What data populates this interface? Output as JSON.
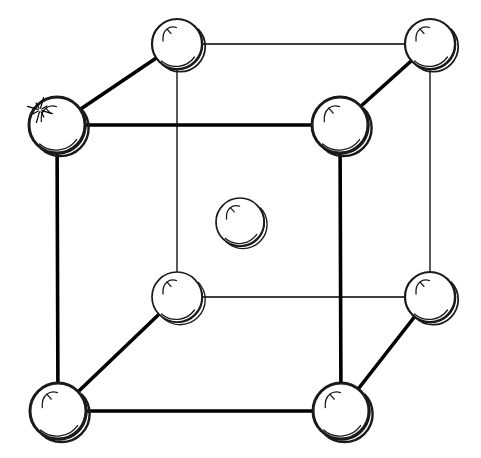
{
  "figure": {
    "background_color": "#ffffff",
    "line_color": "#000000",
    "sphere_fill_color": "#ffffff",
    "sphere_outline_color": "#1a1a1a",
    "canvas": {
      "width": 481,
      "height": 458
    }
  },
  "style": {
    "front_edge_width": 3.6,
    "back_edge_width": 1.3,
    "diagonal_edge_width": 3.6,
    "front_sphere_outline_width": 3.0,
    "back_sphere_outline_width": 1.6,
    "center_sphere_outline_width": 1.6,
    "gloss_stroke_width": 1.3
  },
  "atoms": [
    {
      "id": "corner-front-top-left",
      "label": "front top left corner atom",
      "cx": 57,
      "cy": 125,
      "r": 28,
      "layer": "front",
      "outline_width": 3.0,
      "has_sparkle": true
    },
    {
      "id": "corner-front-top-right",
      "label": "front top right corner atom",
      "cx": 340,
      "cy": 125,
      "r": 28,
      "layer": "front",
      "outline_width": 3.0,
      "has_sparkle": false
    },
    {
      "id": "corner-front-bottom-left",
      "label": "front bottom left corner atom",
      "cx": 58,
      "cy": 411,
      "r": 28,
      "layer": "front",
      "outline_width": 3.0,
      "has_sparkle": false
    },
    {
      "id": "corner-front-bottom-right",
      "label": "front bottom right corner atom",
      "cx": 341,
      "cy": 411,
      "r": 28,
      "layer": "front",
      "outline_width": 3.0,
      "has_sparkle": false
    },
    {
      "id": "corner-back-top-left",
      "label": "back top left corner atom",
      "cx": 177,
      "cy": 44,
      "r": 25,
      "layer": "back",
      "outline_width": 2.2,
      "has_sparkle": false
    },
    {
      "id": "corner-back-top-right",
      "label": "back top right corner atom",
      "cx": 430,
      "cy": 44,
      "r": 25,
      "layer": "back",
      "outline_width": 2.2,
      "has_sparkle": false
    },
    {
      "id": "corner-back-bottom-left",
      "label": "back bottom left corner atom",
      "cx": 177,
      "cy": 297,
      "r": 25,
      "layer": "back",
      "outline_width": 1.7,
      "has_sparkle": false
    },
    {
      "id": "corner-back-bottom-right",
      "label": "back bottom right corner atom",
      "cx": 430,
      "cy": 297,
      "r": 25,
      "layer": "back",
      "outline_width": 2.2,
      "has_sparkle": false
    },
    {
      "id": "atom-body-center",
      "label": "body center atom",
      "cx": 240,
      "cy": 222,
      "r": 24,
      "layer": "center",
      "outline_width": 1.7,
      "has_sparkle": false
    }
  ],
  "edges": [
    {
      "id": "edge-front-top",
      "label": "front top edge",
      "x1": 57,
      "y1": 125,
      "x2": 340,
      "y2": 125,
      "kind": "front"
    },
    {
      "id": "edge-front-left",
      "label": "front left edge",
      "x1": 57,
      "y1": 125,
      "x2": 58,
      "y2": 411,
      "kind": "front"
    },
    {
      "id": "edge-front-right",
      "label": "front right edge",
      "x1": 340,
      "y1": 125,
      "x2": 341,
      "y2": 411,
      "kind": "front"
    },
    {
      "id": "edge-front-bottom",
      "label": "front bottom edge",
      "x1": 58,
      "y1": 411,
      "x2": 341,
      "y2": 411,
      "kind": "front"
    },
    {
      "id": "edge-back-top",
      "label": "back top edge",
      "x1": 177,
      "y1": 44,
      "x2": 430,
      "y2": 44,
      "kind": "back"
    },
    {
      "id": "edge-back-left",
      "label": "back left edge",
      "x1": 177,
      "y1": 44,
      "x2": 177,
      "y2": 297,
      "kind": "back"
    },
    {
      "id": "edge-back-right",
      "label": "back right edge",
      "x1": 430,
      "y1": 44,
      "x2": 430,
      "y2": 297,
      "kind": "back"
    },
    {
      "id": "edge-back-bottom",
      "label": "back bottom edge",
      "x1": 177,
      "y1": 297,
      "x2": 430,
      "y2": 297,
      "kind": "back"
    },
    {
      "id": "edge-diag-top-left",
      "label": "top left connecting edge",
      "x1": 57,
      "y1": 125,
      "x2": 177,
      "y2": 44,
      "kind": "diag"
    },
    {
      "id": "edge-diag-top-right",
      "label": "top right connecting edge",
      "x1": 340,
      "y1": 125,
      "x2": 430,
      "y2": 44,
      "kind": "diag"
    },
    {
      "id": "edge-diag-bottom-left",
      "label": "bottom left connecting edge",
      "x1": 58,
      "y1": 411,
      "x2": 177,
      "y2": 297,
      "kind": "diag"
    },
    {
      "id": "edge-diag-bottom-right",
      "label": "bottom right connecting edge",
      "x1": 341,
      "y1": 411,
      "x2": 430,
      "y2": 297,
      "kind": "diag"
    }
  ],
  "annotations": {
    "sparkle": {
      "id": "sparkle-highlight",
      "label": "sparkle highlight on front top left atom",
      "cx": 40,
      "cy": 110,
      "ray_count": 8,
      "inner_radius": 2,
      "outer_radius": 13
    }
  }
}
